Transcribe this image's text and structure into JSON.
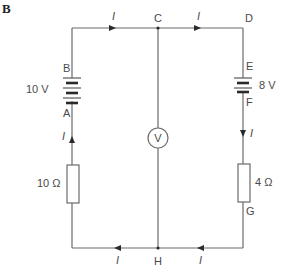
{
  "figure_label": "B",
  "nodes": {
    "A": "A",
    "B": "B",
    "C": "C",
    "D": "D",
    "E": "E",
    "F": "F",
    "G": "G",
    "H": "H"
  },
  "components": {
    "battery_left": {
      "label": "10 V",
      "voltage": 10
    },
    "battery_right": {
      "label": "8 V",
      "voltage": 8
    },
    "resistor_left": {
      "label": "10 Ω",
      "resistance": 10
    },
    "resistor_right": {
      "label": "4 Ω",
      "resistance": 4
    },
    "voltmeter": {
      "label": "V"
    }
  },
  "current_label": "I",
  "current_arrows": [
    {
      "id": "top-left",
      "label": "I",
      "direction": "right"
    },
    {
      "id": "top-right",
      "label": "I",
      "direction": "right"
    },
    {
      "id": "right-down",
      "label": "I",
      "direction": "down"
    },
    {
      "id": "bottom-right",
      "label": "I",
      "direction": "left"
    },
    {
      "id": "bottom-left",
      "label": "I",
      "direction": "left"
    },
    {
      "id": "left-up",
      "label": "I",
      "direction": "up"
    }
  ]
}
